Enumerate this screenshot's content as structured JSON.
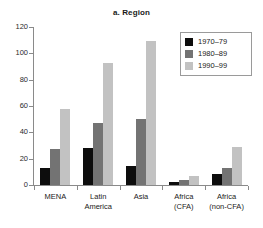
{
  "chart_data": {
    "type": "bar",
    "title": "a. Region",
    "xlabel": "",
    "ylabel": "",
    "ylim": [
      0,
      120
    ],
    "yticks": [
      0,
      20,
      40,
      60,
      80,
      100,
      120
    ],
    "ytick_labels": [
      "0",
      "20",
      "40",
      "60",
      "80",
      "100",
      "120"
    ],
    "grid": false,
    "legend_position": "top-right",
    "categories": [
      "MENA",
      "Latin\nAmerica",
      "Asia",
      "Africa\n(CFA)",
      "Africa\n(non-CFA)"
    ],
    "series": [
      {
        "name": "1970–79",
        "color": "#0d0d0d",
        "values": [
          13,
          28,
          14.5,
          2.5,
          8
        ]
      },
      {
        "name": "1980–89",
        "color": "#737373",
        "values": [
          27,
          47,
          50,
          3.5,
          13
        ]
      },
      {
        "name": "1990–99",
        "color": "#c2c2c2",
        "values": [
          58,
          93,
          109,
          7,
          29
        ]
      }
    ]
  },
  "colors": {
    "series_1970s": "#0d0d0d",
    "series_1980s": "#737373",
    "series_1990s": "#c2c2c2",
    "axis": "#8a8a8a",
    "text": "#1a1a1a",
    "background": "#ffffff"
  }
}
